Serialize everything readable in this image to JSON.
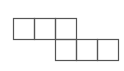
{
  "diagram": {
    "type": "grid-net",
    "stroke_color": "#555555",
    "background": "#ffffff",
    "cell_size": 21,
    "cells": [
      {
        "row": 0,
        "col": 0,
        "x": 13,
        "y": 18
      },
      {
        "row": 0,
        "col": 1,
        "x": 34,
        "y": 18
      },
      {
        "row": 0,
        "col": 2,
        "x": 55,
        "y": 18
      },
      {
        "row": 1,
        "col": 2,
        "x": 55,
        "y": 39
      },
      {
        "row": 1,
        "col": 3,
        "x": 76,
        "y": 39
      },
      {
        "row": 1,
        "col": 4,
        "x": 97,
        "y": 39
      }
    ]
  }
}
